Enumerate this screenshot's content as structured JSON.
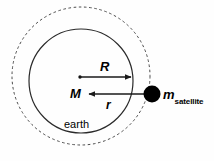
{
  "figure": {
    "kind": "physics-diagram",
    "background_color": "#fefefe",
    "stroke_color": "#1a1a1a",
    "fill_color": "#000000"
  },
  "labels": {
    "radius_earth": "R",
    "mass_earth": "M",
    "radius_orbit": "r",
    "earth": "earth",
    "satellite_symbol": "m",
    "satellite_subscript": "satellite"
  },
  "geometry": {
    "orbit_circle": {
      "cx": 81,
      "cy": 76,
      "r": 69,
      "style": "dashed"
    },
    "earth_circle": {
      "cx": 81,
      "cy": 81,
      "r": 52,
      "style": "solid"
    },
    "center_dot": {
      "cx": 80,
      "cy": 77,
      "r": 1.6
    },
    "satellite_dot": {
      "cx": 152,
      "cy": 94,
      "r": 8.5
    },
    "arrow_R": {
      "x1": 80,
      "y1": 77,
      "x2": 132,
      "y2": 77,
      "direction": "right"
    },
    "arrow_r": {
      "x1": 150,
      "y1": 94,
      "x2": 88,
      "y2": 94,
      "direction": "left"
    }
  }
}
